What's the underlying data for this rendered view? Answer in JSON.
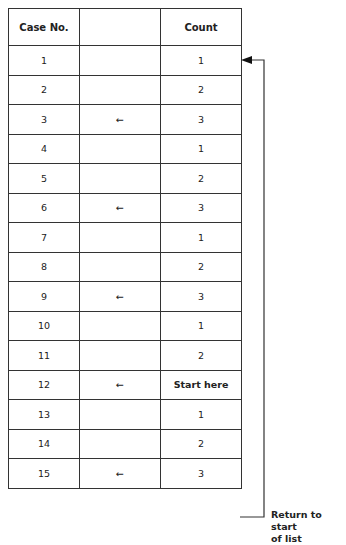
{
  "table": {
    "headers": [
      "Case No.",
      "",
      "Count"
    ],
    "rows": [
      {
        "case": "1",
        "marker": "",
        "count": "1"
      },
      {
        "case": "2",
        "marker": "",
        "count": "2"
      },
      {
        "case": "3",
        "marker": "←",
        "count": "3"
      },
      {
        "case": "4",
        "marker": "",
        "count": "1"
      },
      {
        "case": "5",
        "marker": "",
        "count": "2"
      },
      {
        "case": "6",
        "marker": "←",
        "count": "3"
      },
      {
        "case": "7",
        "marker": "",
        "count": "1"
      },
      {
        "case": "8",
        "marker": "",
        "count": "2"
      },
      {
        "case": "9",
        "marker": "←",
        "count": "3"
      },
      {
        "case": "10",
        "marker": "",
        "count": "1"
      },
      {
        "case": "11",
        "marker": "",
        "count": "2"
      },
      {
        "case": "12",
        "marker": "←",
        "count": "Start here"
      },
      {
        "case": "13",
        "marker": "",
        "count": "1"
      },
      {
        "case": "14",
        "marker": "",
        "count": "2"
      },
      {
        "case": "15",
        "marker": "←",
        "count": "3"
      }
    ]
  },
  "annotation": {
    "line1": "Return to start",
    "line2": "of list"
  }
}
